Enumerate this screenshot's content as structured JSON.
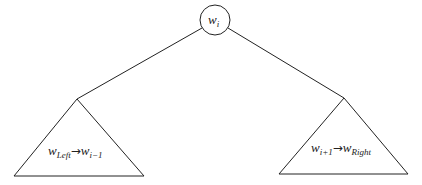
{
  "diagram": {
    "type": "binary-split-tree",
    "root": {
      "label": "w",
      "subscript": "i"
    },
    "left_subtree": {
      "from_label": "w",
      "from_subscript": "Left",
      "arrow": "→",
      "to_label": "w",
      "to_subscript": "i−1"
    },
    "right_subtree": {
      "from_label": "w",
      "from_subscript": "i+1",
      "arrow": "→",
      "to_label": "w",
      "to_subscript": "Right"
    },
    "colors": {
      "stroke": "#222222",
      "background": "#ffffff"
    }
  }
}
